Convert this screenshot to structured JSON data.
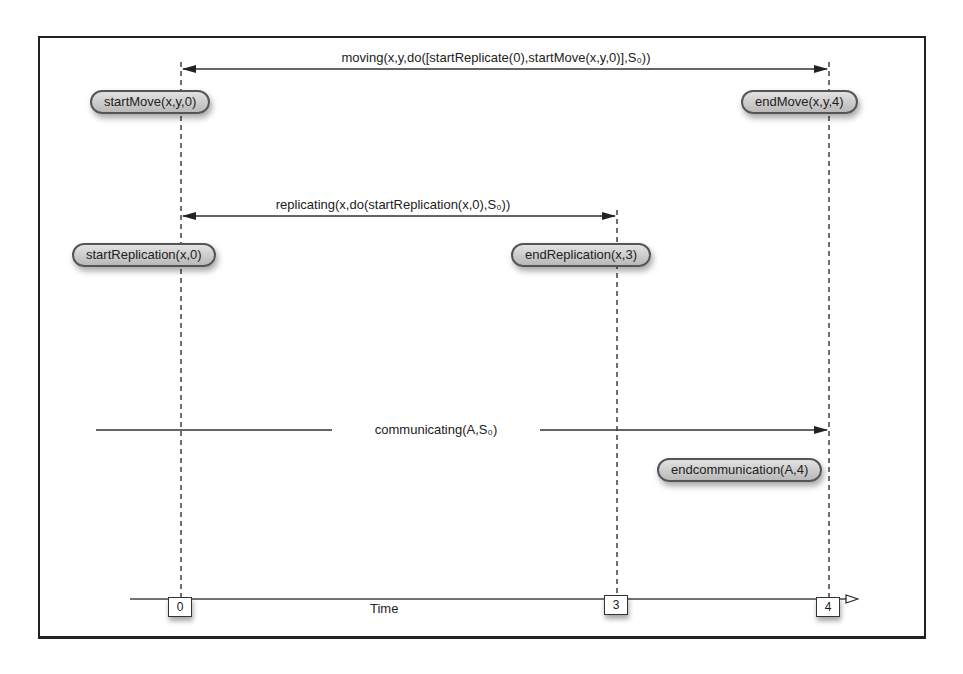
{
  "diagram": {
    "type": "timeline",
    "intervals": [
      {
        "id": "moving",
        "label": "moving(x,y,do([startReplicate(0),startMove(x,y,0)],S₀))",
        "from_time": "0",
        "to_time": "4",
        "arrowheads": "both"
      },
      {
        "id": "replicating",
        "label": "replicating(x,do(startReplication(x,0),S₀))",
        "from_time": "0",
        "to_time": "3",
        "arrowheads": "both"
      },
      {
        "id": "communicating",
        "label": "communicating(A,S₀)",
        "from_time": "before 0",
        "to_time": "4",
        "arrowheads": "end"
      }
    ],
    "events": [
      {
        "id": "startMove",
        "label": "startMove(x,y,0)",
        "time": "0"
      },
      {
        "id": "endMove",
        "label": "endMove(x,y,4)",
        "time": "4"
      },
      {
        "id": "startReplication",
        "label": "startReplication(x,0)",
        "time": "0"
      },
      {
        "id": "endReplication",
        "label": "endReplication(x,3)",
        "time": "3"
      },
      {
        "id": "endcommunication",
        "label": "endcommunication(A,4)",
        "time": "4"
      }
    ],
    "axis": {
      "label": "Time",
      "ticks": [
        "0",
        "3",
        "4"
      ]
    }
  },
  "colors": {
    "line": "#222222",
    "pill_fill_top": "#e2e2e2",
    "pill_fill_bottom": "#b9b9b9",
    "pill_border": "#555555"
  }
}
